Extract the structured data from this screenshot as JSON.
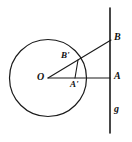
{
  "figure": {
    "background_color": "#ffffff",
    "stroke_color": "#1a1a1a",
    "width": 132,
    "height": 142,
    "labels": {
      "center": "O",
      "point_b_prime": "B'",
      "point_a_prime": "A'",
      "point_b": "B",
      "point_a": "A",
      "line_g": "g"
    }
  },
  "chart_data": {
    "type": "diagram",
    "xlim": [
      0,
      132
    ],
    "ylim": [
      0,
      142
    ],
    "grid": false,
    "legend": null,
    "elements": [
      {
        "kind": "circle",
        "name": "main-circle",
        "cx": 48,
        "cy": 78,
        "r": 38.5,
        "stroke": "#1a1a1a",
        "stroke_width": 1.2,
        "fill": "none"
      },
      {
        "kind": "line",
        "name": "line-g",
        "x1": 110,
        "y1": 8,
        "x2": 110,
        "y2": 133,
        "stroke": "#1a1a1a",
        "stroke_width": 1.6
      },
      {
        "kind": "line",
        "name": "ray-o-to-a",
        "x1": 48,
        "y1": 78,
        "x2": 110,
        "y2": 78,
        "stroke": "#1a1a1a",
        "stroke_width": 1.1
      },
      {
        "kind": "line",
        "name": "ray-o-to-b",
        "x1": 48,
        "y1": 78,
        "x2": 111,
        "y2": 40,
        "stroke": "#1a1a1a",
        "stroke_width": 1.1
      },
      {
        "kind": "line",
        "name": "segment-bprime-to-aprime",
        "x1": 78,
        "y1": 60,
        "x2": 75,
        "y2": 78,
        "stroke": "#1a1a1a",
        "stroke_width": 1.1
      }
    ],
    "points": [
      {
        "name": "O",
        "x": 48,
        "y": 78,
        "label": "O",
        "label_x": 37,
        "label_y": 72
      },
      {
        "name": "B'",
        "x": 78,
        "y": 60,
        "label": "B'",
        "label_x": 61,
        "label_y": 51
      },
      {
        "name": "A'",
        "x": 75,
        "y": 78,
        "label": "A'",
        "label_x": 70,
        "label_y": 80
      },
      {
        "name": "B",
        "x": 110,
        "y": 40,
        "label": "B",
        "label_x": 114,
        "label_y": 32
      },
      {
        "name": "A",
        "x": 110,
        "y": 78,
        "label": "A",
        "label_x": 114,
        "label_y": 71
      },
      {
        "name": "g",
        "x": 110,
        "y": 110,
        "label": "g",
        "label_x": 114,
        "label_y": 104
      }
    ]
  }
}
